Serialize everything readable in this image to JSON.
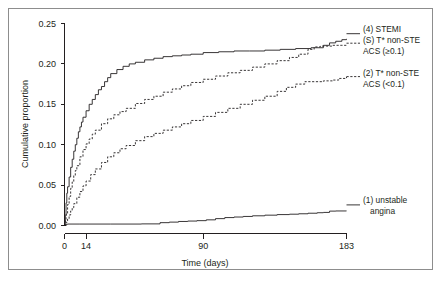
{
  "chart_data": {
    "type": "line",
    "title": "",
    "xlabel": "Time (days)",
    "ylabel": "Cumulative proportion",
    "xlim": [
      0,
      183
    ],
    "ylim": [
      0,
      0.25
    ],
    "xticks": [
      0,
      14,
      90,
      183
    ],
    "xtick_labels": [
      "0",
      "14",
      "90",
      "183"
    ],
    "yticks": [
      0.0,
      0.05,
      0.1,
      0.15,
      0.2,
      0.25
    ],
    "ytick_labels": [
      "0.00",
      "0.05",
      "0.10",
      "0.15",
      "0.20",
      "0.25"
    ],
    "grid": false,
    "legend_position": "right-inline",
    "series": [
      {
        "name": "(4) STEMI",
        "label_lines": [
          "(4) STEMI"
        ],
        "style": "solid",
        "x": [
          0,
          0.5,
          1,
          1.5,
          2,
          3,
          4,
          5,
          6,
          7,
          8,
          9,
          10,
          11,
          12,
          14,
          16,
          18,
          20,
          22,
          24,
          26,
          28,
          30,
          34,
          38,
          42,
          46,
          52,
          58,
          64,
          70,
          76,
          82,
          90,
          100,
          110,
          120,
          130,
          140,
          150,
          160,
          168,
          172,
          176,
          180,
          183
        ],
        "y": [
          0.0,
          0.012,
          0.028,
          0.04,
          0.048,
          0.06,
          0.072,
          0.082,
          0.092,
          0.1,
          0.108,
          0.116,
          0.122,
          0.128,
          0.134,
          0.142,
          0.15,
          0.156,
          0.162,
          0.168,
          0.172,
          0.178,
          0.183,
          0.188,
          0.193,
          0.197,
          0.2,
          0.202,
          0.205,
          0.207,
          0.209,
          0.21,
          0.211,
          0.212,
          0.214,
          0.215,
          0.216,
          0.216,
          0.217,
          0.218,
          0.219,
          0.22,
          0.223,
          0.226,
          0.228,
          0.23,
          0.231
        ]
      },
      {
        "name": "(S) T* non-STE ACS (>=0.1)",
        "label_lines": [
          "(S) T* non-STE",
          "ACS (≥0.1)"
        ],
        "style": "dashed",
        "x": [
          0,
          0.5,
          1,
          2,
          3,
          4,
          5,
          6,
          7,
          8,
          10,
          12,
          14,
          16,
          18,
          20,
          24,
          28,
          32,
          36,
          40,
          46,
          52,
          58,
          64,
          70,
          76,
          82,
          90,
          98,
          106,
          114,
          122,
          130,
          138,
          146,
          152,
          158,
          162,
          166,
          170,
          174,
          178,
          180,
          183
        ],
        "y": [
          0.0,
          0.006,
          0.014,
          0.026,
          0.036,
          0.046,
          0.054,
          0.062,
          0.068,
          0.074,
          0.085,
          0.094,
          0.101,
          0.107,
          0.113,
          0.118,
          0.126,
          0.132,
          0.137,
          0.141,
          0.145,
          0.151,
          0.156,
          0.16,
          0.165,
          0.169,
          0.173,
          0.177,
          0.181,
          0.185,
          0.189,
          0.192,
          0.196,
          0.2,
          0.204,
          0.208,
          0.212,
          0.218,
          0.221,
          0.222,
          0.222,
          0.223,
          0.223,
          0.223,
          0.223
        ]
      },
      {
        "name": "(2) T* non-STE ACS (<0.1)",
        "label_lines": [
          "(2) T* non-STE",
          "ACS (<0.1)"
        ],
        "style": "dashed",
        "x": [
          0,
          1,
          2,
          3,
          4,
          5,
          6,
          8,
          10,
          12,
          14,
          17,
          20,
          24,
          28,
          32,
          36,
          40,
          46,
          52,
          58,
          64,
          70,
          76,
          82,
          90,
          98,
          106,
          114,
          122,
          130,
          138,
          144,
          150,
          156,
          162,
          168,
          174,
          178,
          183
        ],
        "y": [
          0.0,
          0.004,
          0.008,
          0.013,
          0.018,
          0.022,
          0.027,
          0.035,
          0.042,
          0.049,
          0.055,
          0.063,
          0.07,
          0.078,
          0.085,
          0.09,
          0.095,
          0.099,
          0.105,
          0.11,
          0.114,
          0.118,
          0.122,
          0.126,
          0.13,
          0.135,
          0.14,
          0.145,
          0.15,
          0.155,
          0.16,
          0.166,
          0.171,
          0.175,
          0.178,
          0.178,
          0.179,
          0.18,
          0.182,
          0.184
        ]
      },
      {
        "name": "(1) unstable angina",
        "label_lines": [
          "(1) unstable",
          "angina"
        ],
        "style": "solid",
        "x": [
          0,
          1,
          2,
          10,
          30,
          50,
          62,
          68,
          74,
          80,
          86,
          92,
          98,
          104,
          110,
          116,
          122,
          130,
          138,
          146,
          152,
          158,
          164,
          168,
          172,
          176,
          183
        ],
        "y": [
          0.0,
          0.0015,
          0.0018,
          0.0018,
          0.0018,
          0.002,
          0.0035,
          0.0042,
          0.005,
          0.0055,
          0.006,
          0.007,
          0.0085,
          0.0098,
          0.0105,
          0.0112,
          0.012,
          0.0128,
          0.0135,
          0.014,
          0.0145,
          0.0152,
          0.0158,
          0.0162,
          0.0178,
          0.018,
          0.0181
        ]
      }
    ]
  },
  "legend": {
    "stemi_line1": "(4) STEMI",
    "nonste_high_line1": "(S) T* non-STE",
    "nonste_high_line2": "ACS (≥0.1)",
    "nonste_low_line1": "(2) T* non-STE",
    "nonste_low_line2": "ACS (<0.1)",
    "unstable_line1": "(1) unstable",
    "unstable_line2": "angina"
  },
  "axes": {
    "ylabel": "Cumulative proportion",
    "xlabel": "Time (days)",
    "ytick_0": "0.00",
    "ytick_1": "0.05",
    "ytick_2": "0.10",
    "ytick_3": "0.15",
    "ytick_4": "0.20",
    "ytick_5": "0.25",
    "xtick_0": "0",
    "xtick_1": "14",
    "xtick_2": "90",
    "xtick_3": "183"
  },
  "colors": {
    "ink": "#231f20",
    "frame": "#8d8d8d",
    "background": "#ffffff"
  }
}
